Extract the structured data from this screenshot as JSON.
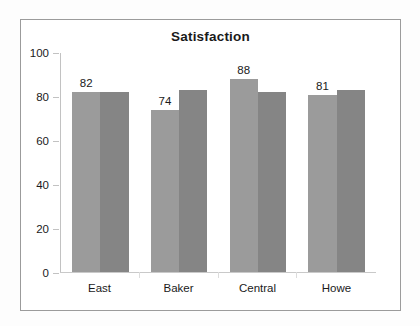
{
  "chart_data": {
    "type": "bar",
    "title": "Satisfaction",
    "xlabel": "",
    "ylabel": "",
    "categories": [
      "East",
      "Baker",
      "Central",
      "Howe"
    ],
    "series": [
      {
        "name": "series-1",
        "color": "#9b9b9b",
        "values": [
          82,
          74,
          88,
          81
        ],
        "labels": [
          "82",
          "74",
          "88",
          "81"
        ],
        "labels_shown": true
      },
      {
        "name": "series-2",
        "color": "#858585",
        "values": [
          82,
          83,
          82,
          83
        ],
        "labels": [
          "",
          "",
          "",
          ""
        ],
        "labels_shown": false
      }
    ],
    "ylim": [
      0,
      100
    ],
    "yticks": [
      0,
      20,
      40,
      60,
      80,
      100
    ],
    "ytick_labels": [
      "0",
      "20",
      "40",
      "60",
      "80",
      "100"
    ],
    "grid": false,
    "legend": "none",
    "frame": true,
    "colors": {
      "series1": "#9b9b9b",
      "series2": "#858585",
      "axis": "#c2c2c2",
      "border": "#9b9b9b",
      "text": "#1a1a1a",
      "background": "#ffffff"
    }
  }
}
